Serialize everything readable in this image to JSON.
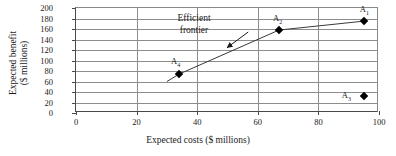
{
  "chart_data": {
    "type": "scatter",
    "title": "",
    "xlabel": "Expected costs ($ millions)",
    "ylabel_line1": "Expected benefit",
    "ylabel_line2": "($ millions)",
    "xlim": [
      0,
      100
    ],
    "ylim": [
      0,
      200
    ],
    "xticks": [
      0,
      20,
      40,
      60,
      80,
      100
    ],
    "yticks": [
      0,
      20,
      40,
      60,
      80,
      100,
      120,
      140,
      160,
      180,
      200
    ],
    "xtick_labels": [
      "0",
      "20",
      "40",
      "60",
      "80",
      "100"
    ],
    "ytick_labels": [
      "0",
      "20",
      "40",
      "60",
      "80",
      "100",
      "120",
      "140",
      "160",
      "180",
      "200"
    ],
    "grid": "both",
    "legend": "none",
    "marker": "diamond",
    "marker_color": "#000000",
    "line_color": "#3a3a3a",
    "points": [
      {
        "name": "A",
        "sub": "1",
        "x": 95,
        "y": 175,
        "label_dx": 0,
        "label_dy": -12
      },
      {
        "name": "A",
        "sub": "2",
        "x": 67,
        "y": 158,
        "label_dx": -2,
        "label_dy": -12
      },
      {
        "name": "A",
        "sub": "3",
        "x": 95,
        "y": 33,
        "label_dx": -18,
        "label_dy": -1
      },
      {
        "name": "A",
        "sub": "4",
        "x": 34,
        "y": 74,
        "label_dx": -4,
        "label_dy": -13
      }
    ],
    "frontier": {
      "label_line1": "Efficient",
      "label_line2": "frontier",
      "vertices": [
        {
          "x": 30,
          "y": 60
        },
        {
          "x": 34,
          "y": 74
        },
        {
          "x": 67,
          "y": 158
        },
        {
          "x": 95,
          "y": 175
        }
      ],
      "arrow_from": {
        "x": 57,
        "y": 152
      },
      "arrow_to": {
        "x": 50,
        "y": 122
      }
    }
  }
}
